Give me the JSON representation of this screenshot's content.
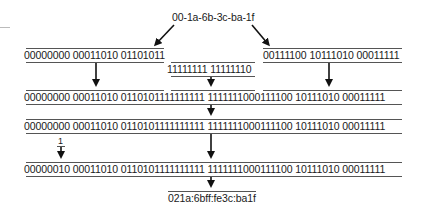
{
  "diagram": {
    "mac_address": "00-1a-6b-3c-ba-1f",
    "step1": {
      "left_half": "00000000 00011010 01101011",
      "inserted": "11111111 11111110",
      "right_half": "00111100 10111010 00011111"
    },
    "step2_combined": "00000000 00011010 0110101111111111 1111111000111100 10111010 00011111",
    "step3_combined": "00000000 00011010 0110101111111111 1111111000111100 10111010 00011111",
    "ul_bit_label": "1",
    "step4_flipped": "00000010 00011010 0110101111111111 1111111000111100 10111010 00011111",
    "interface_id": "021a:6bff:fe3c:ba1f"
  },
  "colors": {
    "text": "#1a1a1a",
    "lines": "#555555",
    "arrows": "#111111"
  }
}
